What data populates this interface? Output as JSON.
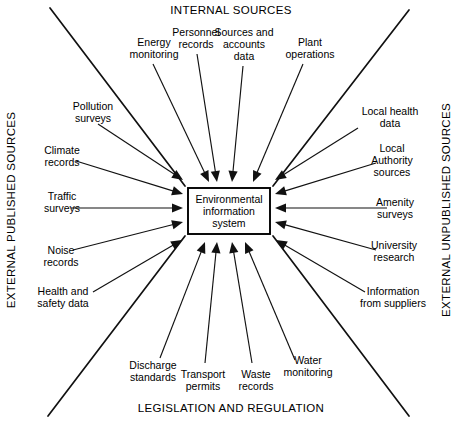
{
  "diagram": {
    "center": {
      "lines": [
        "Environmental",
        "information",
        "system"
      ],
      "box": {
        "x": 188,
        "y": 188,
        "width": 82,
        "height": 46
      }
    },
    "quadrant_titles": {
      "top": "INTERNAL SOURCES",
      "bottom": "LEGISLATION AND REGULATION",
      "left": "EXTERNAL PUBLISHED SOURCES",
      "right": "EXTERNAL UNPUBLISHED SOURCES"
    },
    "colors": {
      "line": "#111111",
      "text": "#000000",
      "background": "#ffffff",
      "box_border": "#000000"
    },
    "sources": [
      {
        "group": "internal",
        "lines": [
          "Energy",
          "monitoring"
        ],
        "text_x": 154,
        "text_y": 46,
        "anchor": "middle",
        "start": [
          153,
          64
        ],
        "end": [
          209,
          182
        ]
      },
      {
        "group": "internal",
        "lines": [
          "Personnel",
          "records"
        ],
        "text_x": 196,
        "text_y": 36,
        "anchor": "middle",
        "start": [
          197,
          54
        ],
        "end": [
          217,
          182
        ]
      },
      {
        "group": "internal",
        "lines": [
          "Sources and",
          "accounts",
          "data"
        ],
        "text_x": 244,
        "text_y": 36,
        "anchor": "middle",
        "start": [
          243,
          66
        ],
        "end": [
          232,
          182
        ]
      },
      {
        "group": "internal",
        "lines": [
          "Plant",
          "operations"
        ],
        "text_x": 310,
        "text_y": 46,
        "anchor": "middle",
        "start": [
          303,
          64
        ],
        "end": [
          253,
          182
        ]
      },
      {
        "group": "external_published",
        "lines": [
          "Pollution",
          "surveys"
        ],
        "text_x": 93,
        "text_y": 110,
        "anchor": "middle",
        "start": [
          98,
          124
        ],
        "end": [
          183,
          180
        ]
      },
      {
        "group": "external_published",
        "lines": [
          "Climate",
          "records"
        ],
        "text_x": 62,
        "text_y": 154,
        "anchor": "middle",
        "start": [
          76,
          161
        ],
        "end": [
          183,
          194
        ]
      },
      {
        "group": "external_published",
        "lines": [
          "Traffic",
          "surveys"
        ],
        "text_x": 62,
        "text_y": 200,
        "anchor": "middle",
        "start": [
          71,
          208
        ],
        "end": [
          183,
          208
        ]
      },
      {
        "group": "external_published",
        "lines": [
          "Noise",
          "records"
        ],
        "text_x": 61,
        "text_y": 254,
        "anchor": "middle",
        "start": [
          73,
          250
        ],
        "end": [
          183,
          222
        ]
      },
      {
        "group": "external_published",
        "lines": [
          "Health and",
          "safety data"
        ],
        "text_x": 63,
        "text_y": 295,
        "anchor": "middle",
        "start": [
          93,
          292
        ],
        "end": [
          182,
          240
        ]
      },
      {
        "group": "legislation",
        "lines": [
          "Discharge",
          "standards"
        ],
        "text_x": 153,
        "text_y": 369,
        "anchor": "middle",
        "start": [
          160,
          358
        ],
        "end": [
          205,
          242
        ]
      },
      {
        "group": "legislation",
        "lines": [
          "Transport",
          "permits"
        ],
        "text_x": 203,
        "text_y": 378,
        "anchor": "middle",
        "start": [
          205,
          363
        ],
        "end": [
          217,
          242
        ]
      },
      {
        "group": "legislation",
        "lines": [
          "Waste",
          "records"
        ],
        "text_x": 256,
        "text_y": 378,
        "anchor": "middle",
        "start": [
          252,
          363
        ],
        "end": [
          232,
          242
        ]
      },
      {
        "group": "legislation",
        "lines": [
          "Water",
          "monitoring"
        ],
        "text_x": 308,
        "text_y": 364,
        "anchor": "middle",
        "start": [
          295,
          360
        ],
        "end": [
          245,
          242
        ]
      },
      {
        "group": "external_unpublished",
        "lines": [
          "Local health",
          "data"
        ],
        "text_x": 390,
        "text_y": 115,
        "anchor": "middle",
        "start": [
          358,
          128
        ],
        "end": [
          275,
          180
        ]
      },
      {
        "group": "external_unpublished",
        "lines": [
          "Local",
          "Authority",
          "sources"
        ],
        "text_x": 392,
        "text_y": 152,
        "anchor": "middle",
        "start": [
          376,
          163
        ],
        "end": [
          275,
          194
        ]
      },
      {
        "group": "external_unpublished",
        "lines": [
          "Amenity",
          "surveys"
        ],
        "text_x": 395,
        "text_y": 206,
        "anchor": "middle",
        "start": [
          387,
          208
        ],
        "end": [
          275,
          208
        ]
      },
      {
        "group": "external_unpublished",
        "lines": [
          "University",
          "research"
        ],
        "text_x": 394,
        "text_y": 249,
        "anchor": "middle",
        "start": [
          376,
          250
        ],
        "end": [
          275,
          222
        ]
      },
      {
        "group": "external_unpublished",
        "lines": [
          "Information",
          "from suppliers"
        ],
        "text_x": 393,
        "text_y": 295,
        "anchor": "middle",
        "start": [
          365,
          292
        ],
        "end": [
          276,
          240
        ]
      }
    ],
    "dividers": [
      {
        "name": "divider-top-left",
        "x1": 50,
        "y1": 8,
        "x2": 185,
        "y2": 186
      },
      {
        "name": "divider-top-right",
        "x1": 409,
        "y1": 10,
        "x2": 273,
        "y2": 186
      },
      {
        "name": "divider-bottom-left",
        "x1": 48,
        "y1": 416,
        "x2": 185,
        "y2": 236
      },
      {
        "name": "divider-bottom-right",
        "x1": 409,
        "y1": 416,
        "x2": 273,
        "y2": 236
      }
    ]
  }
}
